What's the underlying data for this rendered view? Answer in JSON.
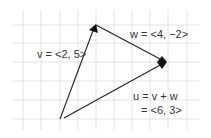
{
  "diagram": {
    "type": "vector-addition",
    "grid": {
      "color": "#e2e2e2"
    },
    "line_color": "#222222",
    "vectors": [
      {
        "name": "v",
        "label": "v = <2, 5>"
      },
      {
        "name": "w",
        "label": "w = <4, −2>"
      },
      {
        "name": "u",
        "label_line1": "u = v + w",
        "label_line2": "= <6, 3>"
      }
    ]
  }
}
